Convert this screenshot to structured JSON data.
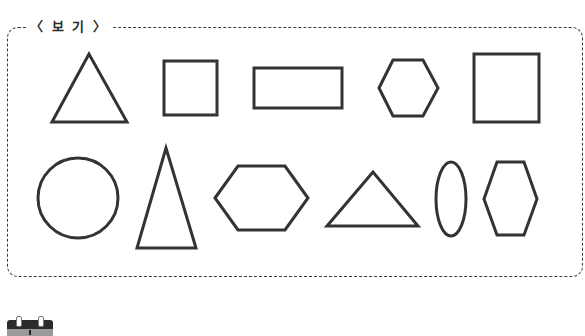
{
  "legend": {
    "label": "〈 보 기 〉"
  },
  "colors": {
    "stroke": "#333333",
    "border": "#3a3a3a",
    "background": "#ffffff"
  },
  "shapes": {
    "row1": [
      {
        "type": "triangle",
        "name": "equilateral-triangle"
      },
      {
        "type": "square",
        "name": "small-square"
      },
      {
        "type": "rectangle",
        "name": "rectangle"
      },
      {
        "type": "hexagon",
        "name": "regular-hexagon"
      },
      {
        "type": "square",
        "name": "large-square"
      }
    ],
    "row2": [
      {
        "type": "circle",
        "name": "circle"
      },
      {
        "type": "triangle",
        "name": "tall-isosceles-triangle"
      },
      {
        "type": "hexagon",
        "name": "wide-hexagon"
      },
      {
        "type": "triangle",
        "name": "flat-triangle"
      },
      {
        "type": "ellipse",
        "name": "ellipse"
      },
      {
        "type": "hexagon",
        "name": "tall-hexagon"
      }
    ]
  },
  "footer_icon": {
    "name": "calendar-icon"
  }
}
